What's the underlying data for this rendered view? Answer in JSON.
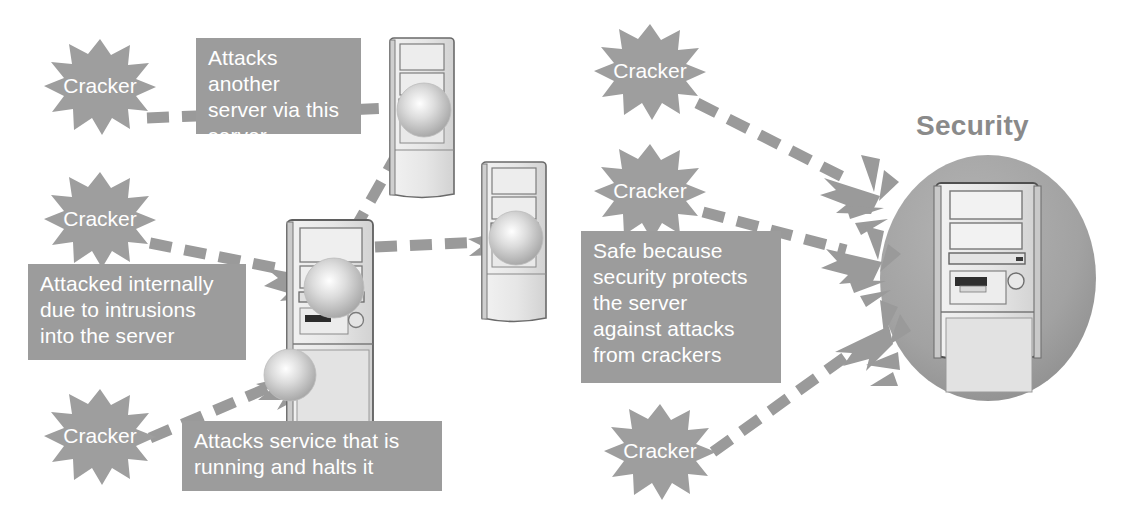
{
  "diagram": {
    "title": "Security protects the server against attacks from crackers",
    "colors": {
      "background": "#ffffff",
      "burst_fill": "#9e9e9e",
      "callout_bg": "#9c9c9c",
      "callout_text": "#ffffff",
      "arrow": "#9a9a9a",
      "shield_circle": "#a0a0a0",
      "server_body": "#e8e8e8",
      "server_outline": "#555555",
      "security_label": "#8a8a8a"
    },
    "left_panel": {
      "bursts": [
        {
          "id": "cracker-1",
          "label": "Cracker",
          "cx": 100,
          "cy": 85
        },
        {
          "id": "cracker-2",
          "label": "Cracker",
          "cx": 100,
          "cy": 218
        },
        {
          "id": "cracker-3",
          "label": "Cracker",
          "cx": 100,
          "cy": 435
        }
      ],
      "callouts": [
        {
          "id": "callout-attacks-another-server",
          "text": "Attacks another\nserver via this\nserver",
          "x": 196,
          "y": 38,
          "w": 165,
          "h": 96
        },
        {
          "id": "callout-attacked-internally",
          "text": "Attacked internally\ndue to intrusions\ninto the server",
          "x": 28,
          "y": 264,
          "w": 218,
          "h": 96
        },
        {
          "id": "callout-attacks-service",
          "text": "Attacks service that is\nrunning and halts it",
          "x": 182,
          "y": 421,
          "w": 260,
          "h": 70
        }
      ],
      "servers": [
        {
          "id": "server-top-right",
          "label": "server",
          "x": 392,
          "y": 36,
          "w": 62,
          "h": 165,
          "attacked": true
        },
        {
          "id": "server-center",
          "label": "server",
          "x": 287,
          "y": 218,
          "w": 86,
          "h": 220,
          "attacked": true
        },
        {
          "id": "server-right",
          "label": "server",
          "x": 484,
          "y": 160,
          "w": 62,
          "h": 165,
          "attacked": true
        }
      ]
    },
    "right_panel": {
      "security_label": "Security",
      "bursts": [
        {
          "id": "cracker-4",
          "label": "Cracker",
          "cx": 650,
          "cy": 70
        },
        {
          "id": "cracker-5",
          "label": "Cracker",
          "cx": 650,
          "cy": 190
        },
        {
          "id": "cracker-6",
          "label": "Cracker",
          "cx": 660,
          "cy": 450
        }
      ],
      "callouts": [
        {
          "id": "callout-safe-because",
          "text": "Safe because\nsecurity protects\nthe server\nagainst attacks\nfrom crackers",
          "x": 581,
          "y": 231,
          "w": 200,
          "h": 152
        }
      ],
      "shielded_server": {
        "id": "server-protected",
        "label": "server",
        "circle": {
          "cx": 988,
          "cy": 278,
          "rx": 108,
          "ry": 123
        }
      }
    }
  }
}
